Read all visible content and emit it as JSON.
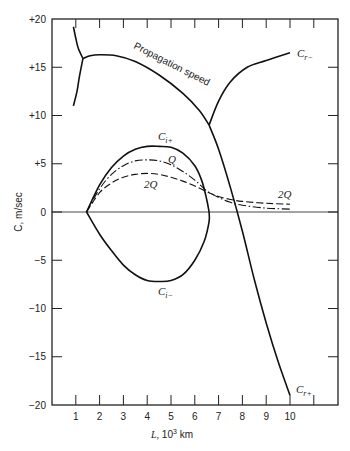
{
  "chart_data": {
    "type": "line",
    "title": "",
    "xlabel": "L, 10^3 km",
    "ylabel": "C, m/sec",
    "xlim": [
      0,
      11.8
    ],
    "ylim": [
      -20,
      20
    ],
    "grid": false,
    "legend": "none (curves labeled inline)",
    "x_ticks": [
      1,
      2,
      3,
      4,
      5,
      6,
      7,
      8,
      9,
      10,
      11
    ],
    "x_tick_labels": [
      "1",
      "2",
      "3",
      "4",
      "5",
      "6",
      "7",
      "8",
      "9",
      "10",
      ""
    ],
    "y_ticks": [
      20,
      15,
      10,
      5,
      0,
      -5,
      -10,
      -15,
      -20
    ],
    "y_tick_labels": [
      "+20",
      "+15",
      "+10",
      "+5",
      "0",
      "−5",
      "−10",
      "−15",
      "−20"
    ],
    "series": [
      {
        "name": "Propagation speed (upper-left branch)",
        "style": "solid",
        "points": [
          [
            0.9,
            19.2
          ],
          [
            1.0,
            18.0
          ],
          [
            1.1,
            17.0
          ],
          [
            1.3,
            15.9
          ]
        ]
      },
      {
        "name": "Propagation speed (lower-left branch)",
        "style": "solid",
        "points": [
          [
            1.3,
            15.9
          ],
          [
            1.15,
            14.0
          ],
          [
            1.05,
            12.5
          ],
          [
            0.9,
            11.0
          ]
        ]
      },
      {
        "name": "Propagation speed",
        "label": "Propagation speed",
        "style": "solid",
        "points": [
          [
            1.3,
            15.9
          ],
          [
            1.6,
            16.2
          ],
          [
            2.0,
            16.3
          ],
          [
            2.7,
            16.2
          ],
          [
            3.5,
            15.6
          ],
          [
            4.5,
            14.2
          ],
          [
            5.5,
            12.3
          ],
          [
            6.2,
            10.5
          ],
          [
            6.6,
            9.0
          ]
        ]
      },
      {
        "name": "C_r-",
        "label": "C_r−",
        "style": "solid",
        "points": [
          [
            6.6,
            9.0
          ],
          [
            7.0,
            11.5
          ],
          [
            7.5,
            13.5
          ],
          [
            8.2,
            15.0
          ],
          [
            9.0,
            15.7
          ],
          [
            10.0,
            16.5
          ]
        ]
      },
      {
        "name": "C_r+",
        "label": "C_r+",
        "style": "solid",
        "points": [
          [
            6.6,
            9.0
          ],
          [
            7.0,
            6.5
          ],
          [
            7.5,
            2.5
          ],
          [
            8.0,
            -2.0
          ],
          [
            8.5,
            -7.0
          ],
          [
            9.0,
            -11.5
          ],
          [
            9.5,
            -15.5
          ],
          [
            10.0,
            -19.0
          ]
        ]
      },
      {
        "name": "C_i+",
        "label": "C_i+",
        "style": "solid",
        "points": [
          [
            1.45,
            0.0
          ],
          [
            2.0,
            2.8
          ],
          [
            2.5,
            4.6
          ],
          [
            3.0,
            5.8
          ],
          [
            3.5,
            6.5
          ],
          [
            4.0,
            6.8
          ],
          [
            4.5,
            6.8
          ],
          [
            5.0,
            6.7
          ],
          [
            5.5,
            6.1
          ],
          [
            6.0,
            4.8
          ],
          [
            6.3,
            3.2
          ],
          [
            6.5,
            1.3
          ],
          [
            6.6,
            0.0
          ]
        ]
      },
      {
        "name": "C_i-",
        "label": "C_i−",
        "style": "solid",
        "points": [
          [
            1.45,
            0.0
          ],
          [
            2.0,
            -2.3
          ],
          [
            2.5,
            -4.0
          ],
          [
            3.0,
            -5.5
          ],
          [
            3.5,
            -6.5
          ],
          [
            4.0,
            -7.1
          ],
          [
            4.55,
            -7.2
          ],
          [
            5.0,
            -7.1
          ],
          [
            5.5,
            -6.5
          ],
          [
            6.0,
            -5.0
          ],
          [
            6.4,
            -3.0
          ],
          [
            6.6,
            -1.0
          ],
          [
            6.6,
            0.0
          ]
        ]
      },
      {
        "name": "Q",
        "label": "Q",
        "style": "dash-dot",
        "points": [
          [
            1.45,
            0.0
          ],
          [
            2.0,
            2.4
          ],
          [
            2.5,
            3.9
          ],
          [
            3.0,
            4.8
          ],
          [
            3.5,
            5.3
          ],
          [
            4.0,
            5.4
          ],
          [
            4.5,
            5.3
          ],
          [
            5.0,
            4.9
          ],
          [
            5.5,
            4.2
          ],
          [
            6.0,
            3.3
          ],
          [
            6.5,
            2.2
          ],
          [
            7.0,
            1.5
          ],
          [
            7.5,
            1.0
          ],
          [
            8.0,
            0.7
          ],
          [
            9.0,
            0.4
          ],
          [
            10.0,
            0.3
          ]
        ]
      },
      {
        "name": "2Q",
        "label": "2Q",
        "style": "dashed",
        "points": [
          [
            1.45,
            0.0
          ],
          [
            2.0,
            2.0
          ],
          [
            2.5,
            3.0
          ],
          [
            3.0,
            3.6
          ],
          [
            3.5,
            3.9
          ],
          [
            4.0,
            4.0
          ],
          [
            4.5,
            3.9
          ],
          [
            5.0,
            3.6
          ],
          [
            5.5,
            3.2
          ],
          [
            6.0,
            2.7
          ],
          [
            6.5,
            2.1
          ],
          [
            7.0,
            1.6
          ],
          [
            7.5,
            1.3
          ],
          [
            8.0,
            1.1
          ],
          [
            9.0,
            0.9
          ],
          [
            10.0,
            0.8
          ]
        ]
      }
    ],
    "annotations": [
      {
        "text": "Propagation speed",
        "near": [
          4.2,
          15.5
        ],
        "rotated": true
      },
      {
        "text": "C_r−",
        "at": [
          10.3,
          16.3
        ]
      },
      {
        "text": "C_r+",
        "at": [
          10.3,
          -18.6
        ]
      },
      {
        "text": "C_i+",
        "at": [
          4.6,
          7.8
        ]
      },
      {
        "text": "C_i−",
        "at": [
          4.6,
          -9.3
        ]
      },
      {
        "text": "Q",
        "at": [
          5.0,
          5.7
        ]
      },
      {
        "text": "2Q",
        "at": [
          4.5,
          3.0
        ]
      },
      {
        "text": "2Q",
        "at": [
          9.5,
          1.6
        ]
      }
    ]
  },
  "labels": {
    "xlabel_main": "L,",
    "xlabel_unit": " 10",
    "xlabel_exp": "3",
    "xlabel_km": " km",
    "ylabel": "C, m/sec",
    "propagation": "Propagation speed",
    "cr_minus_main": "C",
    "cr_minus_sub": "r−",
    "cr_plus_main": "C",
    "cr_plus_sub": "r+",
    "ci_plus_main": "C",
    "ci_plus_sub": "i+",
    "ci_minus_main": "C",
    "ci_minus_sub": "i−",
    "q": "Q",
    "two_q_left": "2Q",
    "two_q_right": "2Q"
  }
}
